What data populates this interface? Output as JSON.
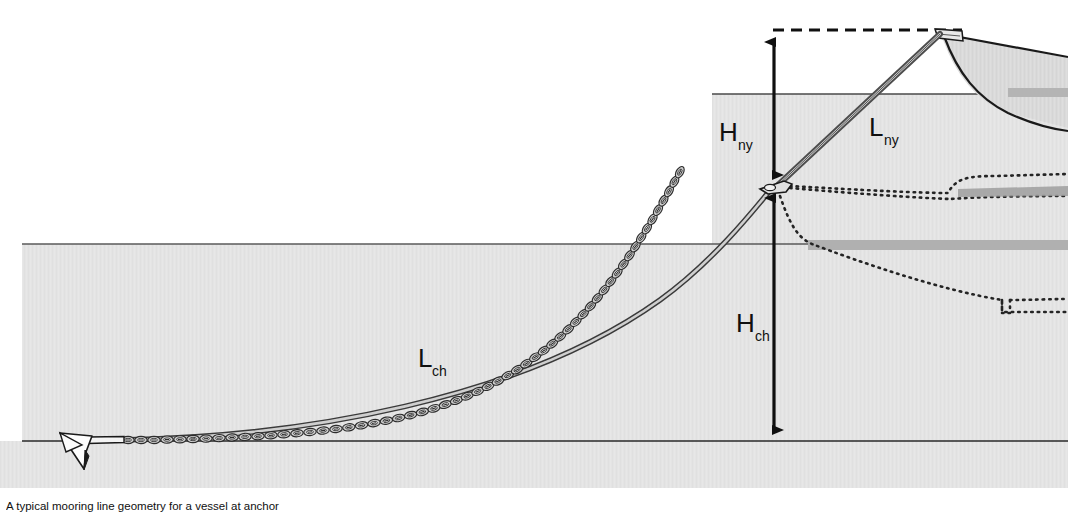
{
  "figure": {
    "caption": "A typical mooring line geometry for a vessel at anchor",
    "background_color": "#ffffff",
    "water_color": "#e3e3e3",
    "seabed_color": "#e3e3e3",
    "hull_fill_color": "#dcdcdc",
    "hull_stripe_color": "#bcbcbc",
    "line_color": "#1a1a1a",
    "chain_color": "#3a3a3a",
    "rope_color": "#6b6b6b",
    "dotted_color": "#2a2a2a"
  },
  "labels": {
    "h_ny": {
      "symbol": "H",
      "subscript": "ny",
      "meaning": "vertical height of nylon rope segment"
    },
    "l_ny": {
      "symbol": "L",
      "subscript": "ny",
      "meaning": "length of nylon rope segment"
    },
    "h_ch": {
      "symbol": "H",
      "subscript": "ch",
      "meaning": "vertical height of chain segment"
    },
    "l_ch": {
      "symbol": "L",
      "subscript": "ch",
      "meaning": "length of chain segment"
    }
  },
  "elements": {
    "anchor": "anchor-icon",
    "chain": "chain-line",
    "rope": "nylon-rope-line",
    "connector": "chain-rope-connector",
    "fairlead": "bow-fairlead",
    "vessel": "vessel-bow-profile",
    "submerged_hull": "submerged-hull-dotted-outline",
    "waterline_upper": "sea-surface-line",
    "waterline_lower": "submerged-reference-line",
    "seabed": "seabed-line",
    "datum_dashed": "horizontal-datum-dashed-line"
  },
  "geometry": {
    "sea_surface_y": 94,
    "mid_reference_y": 244,
    "seabed_y": 441,
    "datum_dashed_y": 30,
    "dimension_axis_x": 774,
    "connector_point": {
      "x": 775,
      "y": 186
    },
    "fairlead_point": {
      "x": 938,
      "y": 33
    },
    "anchor_point": {
      "x": 70,
      "y": 440
    },
    "canvas": {
      "width": 1068,
      "height": 513
    }
  }
}
